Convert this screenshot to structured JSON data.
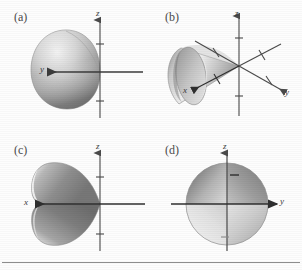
{
  "figure": {
    "caption_rule": true,
    "background": "#fdfdfd",
    "panels": [
      {
        "id": "a",
        "label": "(a)",
        "view": "end-on view down the x-axis; cone appears as a shaded ellipse/disk",
        "axes": [
          {
            "name": "z",
            "label": "z",
            "direction": "up",
            "ticks": 2
          },
          {
            "name": "y",
            "label": "y",
            "direction": "left",
            "ticks": 0
          }
        ]
      },
      {
        "id": "b",
        "label": "(b)",
        "view": "oblique 3D view; cone opens toward lower-left along the x-axis",
        "axes": [
          {
            "name": "z",
            "label": "z",
            "direction": "up",
            "ticks": 2
          },
          {
            "name": "y",
            "label": "y",
            "direction": "lower-right",
            "ticks": 2
          },
          {
            "name": "x",
            "label": "x",
            "direction": "lower-left",
            "ticks": 2
          }
        ]
      },
      {
        "id": "c",
        "label": "(c)",
        "view": "side view in the x-z plane; cone apex at origin opening to the left",
        "axes": [
          {
            "name": "z",
            "label": "z",
            "direction": "up",
            "ticks": 2
          },
          {
            "name": "x",
            "label": "x",
            "direction": "left",
            "ticks": 0
          }
        ]
      },
      {
        "id": "d",
        "label": "(d)",
        "view": "view down the cone axis in the y-z plane; cone appears as a shaded circle",
        "axes": [
          {
            "name": "z",
            "label": "z",
            "direction": "up",
            "ticks": 1
          },
          {
            "name": "y",
            "label": "y",
            "direction": "right",
            "ticks": 0
          }
        ]
      }
    ],
    "colors": {
      "axis": "#4a4a4a",
      "label": "#3b3b3b",
      "surface_light": "#e6e6e6",
      "surface_mid": "#b4b4b4",
      "surface_dark": "#6e6e6e",
      "rule": "#8d8d8d"
    }
  }
}
